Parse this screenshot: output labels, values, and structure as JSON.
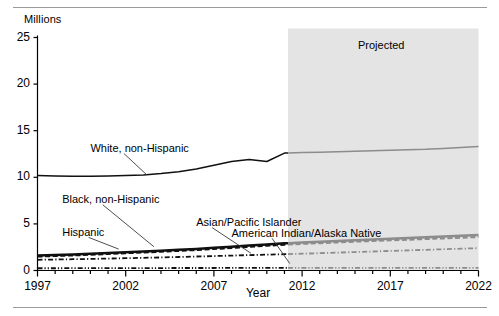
{
  "figure": {
    "y_axis_unit_label": "Millions",
    "x_axis_title": "Year",
    "projection_label": "Projected"
  },
  "chart_data": {
    "type": "line",
    "title": "",
    "subtitle": "",
    "xlabel": "Year",
    "ylabel": "Millions",
    "xlim": [
      1997,
      2022
    ],
    "ylim": [
      0,
      25
    ],
    "ytick_labels": [
      "0",
      "5",
      "10",
      "15",
      "20",
      "25"
    ],
    "ytick_values": [
      0,
      5,
      10,
      15,
      20,
      25
    ],
    "xtick_labels": [
      "1997",
      "2002",
      "2007",
      "2012",
      "2017",
      "2022"
    ],
    "xtick_values": [
      1997,
      2002,
      2007,
      2012,
      2017,
      2022
    ],
    "minor_xticks": "every 1 year",
    "grid": false,
    "legend": "inline data labels with leader lines",
    "projection_start_year": 2011.2,
    "projection_shading_color": "#e4e4e4",
    "annotations": [
      {
        "text": "Projected",
        "x": 2017.5,
        "y": 23.6
      }
    ],
    "x": [
      1997,
      1998,
      1999,
      2000,
      2001,
      2002,
      2003,
      2004,
      2005,
      2006,
      2007,
      2008,
      2009,
      2010,
      2011,
      2012,
      2013,
      2014,
      2015,
      2016,
      2017,
      2018,
      2019,
      2020,
      2021,
      2022
    ],
    "series": [
      {
        "name": "White, non-Hispanic",
        "style": "solid",
        "label_x": 2000.0,
        "label_y": 13.0,
        "values": [
          10.2,
          10.15,
          10.1,
          10.1,
          10.15,
          10.2,
          10.25,
          10.4,
          10.6,
          10.9,
          11.3,
          11.7,
          11.9,
          11.7,
          12.6,
          12.65,
          12.7,
          12.75,
          12.8,
          12.85,
          12.9,
          12.95,
          13.0,
          13.1,
          13.2,
          13.3
        ]
      },
      {
        "name": "Hispanic",
        "style": "solid-thick",
        "label_x": 1998.4,
        "label_y": 4.0,
        "values": [
          1.6,
          1.66,
          1.72,
          1.8,
          1.88,
          1.97,
          2.05,
          2.13,
          2.22,
          2.32,
          2.44,
          2.56,
          2.68,
          2.8,
          2.92,
          3.0,
          3.08,
          3.16,
          3.24,
          3.32,
          3.4,
          3.48,
          3.56,
          3.64,
          3.72,
          3.8
        ]
      },
      {
        "name": "Black, non-Hispanic",
        "style": "dashed",
        "label_x": 1998.4,
        "label_y": 7.6,
        "values": [
          1.5,
          1.56,
          1.62,
          1.7,
          1.78,
          1.86,
          1.94,
          2.02,
          2.11,
          2.2,
          2.31,
          2.42,
          2.54,
          2.66,
          2.78,
          2.86,
          2.94,
          3.02,
          3.1,
          3.17,
          3.24,
          3.31,
          3.38,
          3.45,
          3.52,
          3.6
        ]
      },
      {
        "name": "Asian/Pacific Islander",
        "style": "dash-dot",
        "label_x": 2006.0,
        "label_y": 5.1,
        "values": [
          1.15,
          1.18,
          1.21,
          1.24,
          1.28,
          1.32,
          1.36,
          1.4,
          1.45,
          1.5,
          1.55,
          1.6,
          1.65,
          1.7,
          1.75,
          1.8,
          1.86,
          1.92,
          1.98,
          2.04,
          2.1,
          2.16,
          2.22,
          2.28,
          2.34,
          2.4
        ]
      },
      {
        "name": "American Indian/Alaska Native",
        "style": "dash-dot-dot",
        "label_x": 2008.0,
        "label_y": 3.9,
        "values": [
          0.24,
          0.24,
          0.25,
          0.25,
          0.25,
          0.26,
          0.26,
          0.26,
          0.27,
          0.27,
          0.27,
          0.28,
          0.28,
          0.28,
          0.28,
          0.28,
          0.28,
          0.28,
          0.28,
          0.28,
          0.28,
          0.28,
          0.28,
          0.28,
          0.28,
          0.28
        ]
      }
    ]
  }
}
